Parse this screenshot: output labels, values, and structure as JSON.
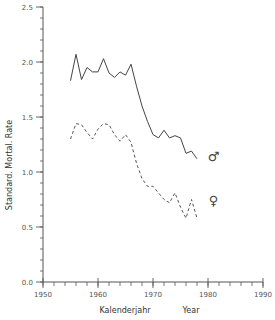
{
  "chart_data": {
    "type": "line",
    "title": "",
    "xlabel": "Kalenderjahr",
    "xlabel_en": "Year",
    "ylabel": "Standard. Mortal. Rate",
    "xlim": [
      1950,
      1990
    ],
    "ylim": [
      0.0,
      2.5
    ],
    "x_ticks": [
      1950,
      1960,
      1970,
      1980,
      1990
    ],
    "x_minor_step": 2,
    "y_ticks": [
      "0.0",
      "0.5",
      "1.0",
      "1.5",
      "2.0",
      "2.5"
    ],
    "y_minor_step": 0.1,
    "grid": false,
    "legend": "inline symbols at line ends",
    "series": [
      {
        "name": "Male",
        "symbol": "♂",
        "style": "solid",
        "color": "#444444",
        "x": [
          1955,
          1956,
          1957,
          1958,
          1959,
          1960,
          1961,
          1962,
          1963,
          1964,
          1965,
          1966,
          1967,
          1968,
          1969,
          1970,
          1971,
          1972,
          1973,
          1974,
          1975,
          1976,
          1977,
          1978
        ],
        "values": [
          1.83,
          2.07,
          1.84,
          1.95,
          1.91,
          1.91,
          2.03,
          1.9,
          1.86,
          1.91,
          1.88,
          1.98,
          1.78,
          1.6,
          1.46,
          1.34,
          1.31,
          1.38,
          1.31,
          1.33,
          1.31,
          1.17,
          1.19,
          1.12
        ]
      },
      {
        "name": "Female",
        "symbol": "♀",
        "style": "dashed",
        "color": "#555555",
        "x": [
          1955,
          1956,
          1957,
          1958,
          1959,
          1960,
          1961,
          1962,
          1963,
          1964,
          1965,
          1966,
          1967,
          1968,
          1969,
          1970,
          1971,
          1972,
          1973,
          1974,
          1975,
          1976,
          1977,
          1978
        ],
        "values": [
          1.3,
          1.44,
          1.43,
          1.36,
          1.3,
          1.39,
          1.44,
          1.43,
          1.34,
          1.28,
          1.34,
          1.27,
          1.08,
          0.94,
          0.87,
          0.87,
          0.81,
          0.75,
          0.72,
          0.81,
          0.68,
          0.58,
          0.75,
          0.58
        ]
      }
    ],
    "annotations": [
      {
        "text": "♂",
        "near_series": "Male",
        "x": 1981,
        "y": 1.15
      },
      {
        "text": "♀",
        "near_series": "Female",
        "x": 1981,
        "y": 0.75
      }
    ]
  }
}
